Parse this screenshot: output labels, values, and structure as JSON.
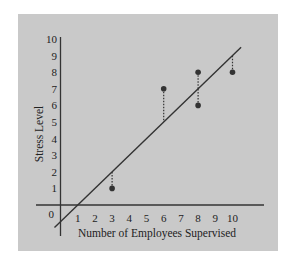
{
  "chart_data": {
    "type": "scatter",
    "title": "",
    "xlabel": "Number of Employees Supervised",
    "ylabel": "Stress Level",
    "x_ticks": [
      "1",
      "2",
      "3",
      "4",
      "5",
      "6",
      "7",
      "8",
      "9",
      "10"
    ],
    "y_ticks": [
      "0",
      "1",
      "2",
      "3",
      "4",
      "5",
      "6",
      "7",
      "8",
      "9",
      "10"
    ],
    "xlim": [
      -0.5,
      11.8
    ],
    "ylim": [
      -1.9,
      10
    ],
    "grid": false,
    "series": [
      {
        "name": "Observed",
        "points": [
          [
            3,
            1
          ],
          [
            6,
            7
          ],
          [
            8,
            8
          ],
          [
            8,
            6
          ],
          [
            10,
            8
          ]
        ]
      }
    ],
    "regression_line": {
      "slope": 1.0,
      "intercept": -1.0,
      "x_start": -0.35,
      "x_end": 10.5
    },
    "residuals": [
      {
        "x": 3,
        "y_obs": 1,
        "y_pred": 2
      },
      {
        "x": 6,
        "y_obs": 7,
        "y_pred": 5
      },
      {
        "x": 8,
        "y_obs": 8,
        "y_pred": 7
      },
      {
        "x": 8,
        "y_obs": 6,
        "y_pred": 7
      },
      {
        "x": 10,
        "y_obs": 8,
        "y_pred": 9
      }
    ],
    "colors": {
      "background": "#c9c9c9",
      "ink": "#333333"
    }
  }
}
